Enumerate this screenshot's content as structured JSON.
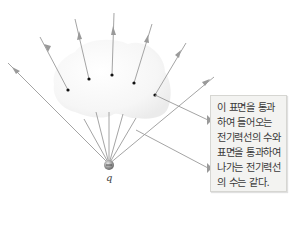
{
  "figure": {
    "charge_label": "q",
    "charge_sign": "+",
    "callout": {
      "lines": [
        "이 표면을 통과",
        "하여 들어오는",
        "전기력선의 수와",
        "표면을 통과하여",
        "나가는 전기력선",
        "의 수는 같다."
      ]
    },
    "colors": {
      "field_line": "#9a9a9a",
      "surface_fill": "#f4f4f4",
      "callout_bg": "#f3f3f1",
      "callout_border": "#d6d6d2",
      "dot": "#111111"
    },
    "field_line_count": 9,
    "surface_dot_count": 5
  }
}
